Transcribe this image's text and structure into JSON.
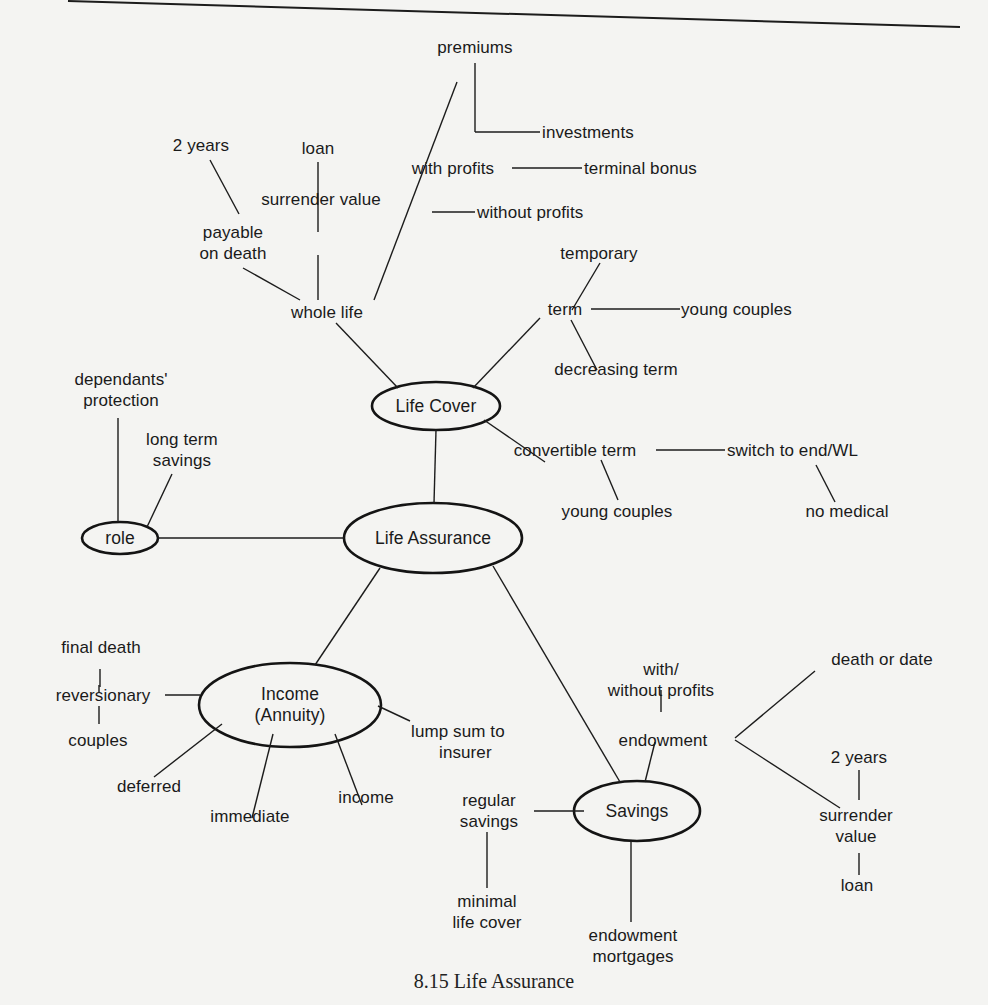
{
  "figure": {
    "caption": "8.15 Life Assurance",
    "colors": {
      "background": "#f4f4f2",
      "ink": "#1a1a1a"
    }
  },
  "nodes": {
    "life_assurance": "Life Assurance",
    "life_cover": "Life Cover",
    "role": "role",
    "income": [
      "Income",
      "(Annuity)"
    ],
    "savings": "Savings"
  },
  "labels": {
    "premiums": "premiums",
    "investments": "investments",
    "with_profits": "with profits",
    "terminal_bonus": "terminal bonus",
    "without_profits": "without profits",
    "two_years_top": "2 years",
    "loan_top": "loan",
    "surrender_value_top": "surrender value",
    "payable_on_death": [
      "payable",
      "on death"
    ],
    "whole_life": "whole life",
    "temporary": "temporary",
    "term": "term",
    "young_couples_term": "young couples",
    "decreasing_term": "decreasing term",
    "dependants_protection": [
      "dependants'",
      "protection"
    ],
    "long_term_savings": [
      "long term",
      "savings"
    ],
    "convertible_term": "convertible term",
    "switch_to_end_wl": "switch to end/WL",
    "young_couples_convertible": "young couples",
    "no_medical": "no medical",
    "final_death": "final death",
    "reversionary": "reversionary",
    "couples": "couples",
    "deferred": "deferred",
    "immediate": "immediate",
    "income_leaf": "income",
    "lump_sum_to_insurer": [
      "lump sum to",
      "insurer"
    ],
    "with_without_profits": [
      "with/",
      "without profits"
    ],
    "endowment": "endowment",
    "death_or_date": "death or date",
    "two_years_bottom": "2 years",
    "surrender_value_bottom": [
      "surrender",
      "value"
    ],
    "loan_bottom": "loan",
    "regular_savings": [
      "regular",
      "savings"
    ],
    "minimal_life_cover": [
      "minimal",
      "life cover"
    ],
    "endowment_mortgages": [
      "endowment",
      "mortgages"
    ]
  }
}
